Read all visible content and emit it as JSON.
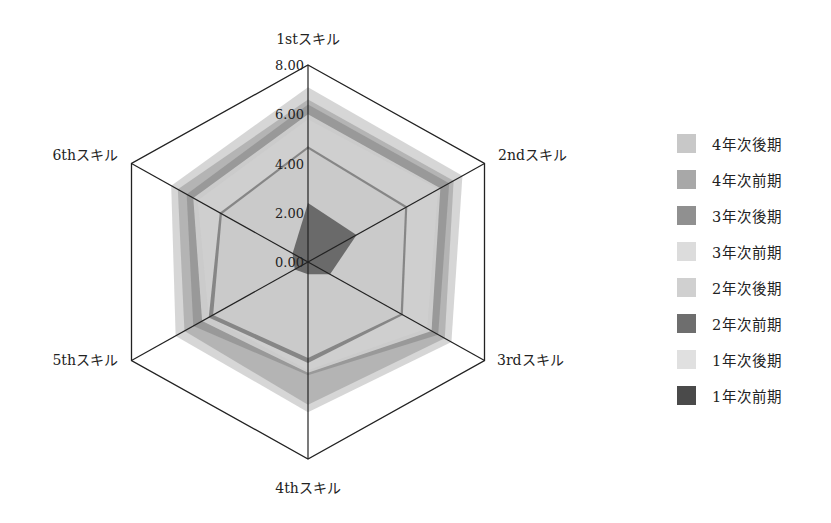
{
  "chart_data": {
    "type": "radar",
    "title": "",
    "categories": [
      "1stスキル",
      "2ndスキル",
      "3rdスキル",
      "4thスキル",
      "5thスキル",
      "6thスキル"
    ],
    "radial_ticks": [
      "0.00",
      "2.00",
      "4.00",
      "6.00",
      "8.00"
    ],
    "rlim": [
      0,
      8
    ],
    "grid": "outer hexagon + spokes",
    "legend_position": "right",
    "series": [
      {
        "name": "4年次後期",
        "color": "#c8c8c8",
        "values": [
          7.1,
          7.0,
          6.5,
          6.1,
          6.0,
          6.2
        ]
      },
      {
        "name": "4年次前期",
        "color": "#a8a8a8",
        "values": [
          6.6,
          6.6,
          6.2,
          5.8,
          5.6,
          5.9
        ]
      },
      {
        "name": "3年次後期",
        "color": "#909090",
        "values": [
          6.4,
          6.4,
          5.9,
          4.6,
          5.2,
          5.5
        ]
      },
      {
        "name": "3年次前期",
        "color": "#dcdcdc",
        "values": [
          6.0,
          6.0,
          5.6,
          4.5,
          4.8,
          5.2
        ]
      },
      {
        "name": "2年次後期",
        "color": "#d0d0d0",
        "values": [
          5.8,
          5.9,
          5.4,
          4.4,
          4.5,
          5.0
        ]
      },
      {
        "name": "2年次前期",
        "color": "#6e6e6e",
        "values": [
          4.7,
          4.5,
          4.3,
          4.1,
          4.5,
          4.0
        ]
      },
      {
        "name": "1年次後期",
        "color": "#e0e0e0",
        "values": [
          4.6,
          4.4,
          4.2,
          3.9,
          4.3,
          3.9
        ]
      },
      {
        "name": "1年次前期",
        "color": "#4a4a4a",
        "values": [
          2.4,
          2.2,
          1.0,
          0.5,
          0.6,
          0.7
        ]
      }
    ]
  }
}
